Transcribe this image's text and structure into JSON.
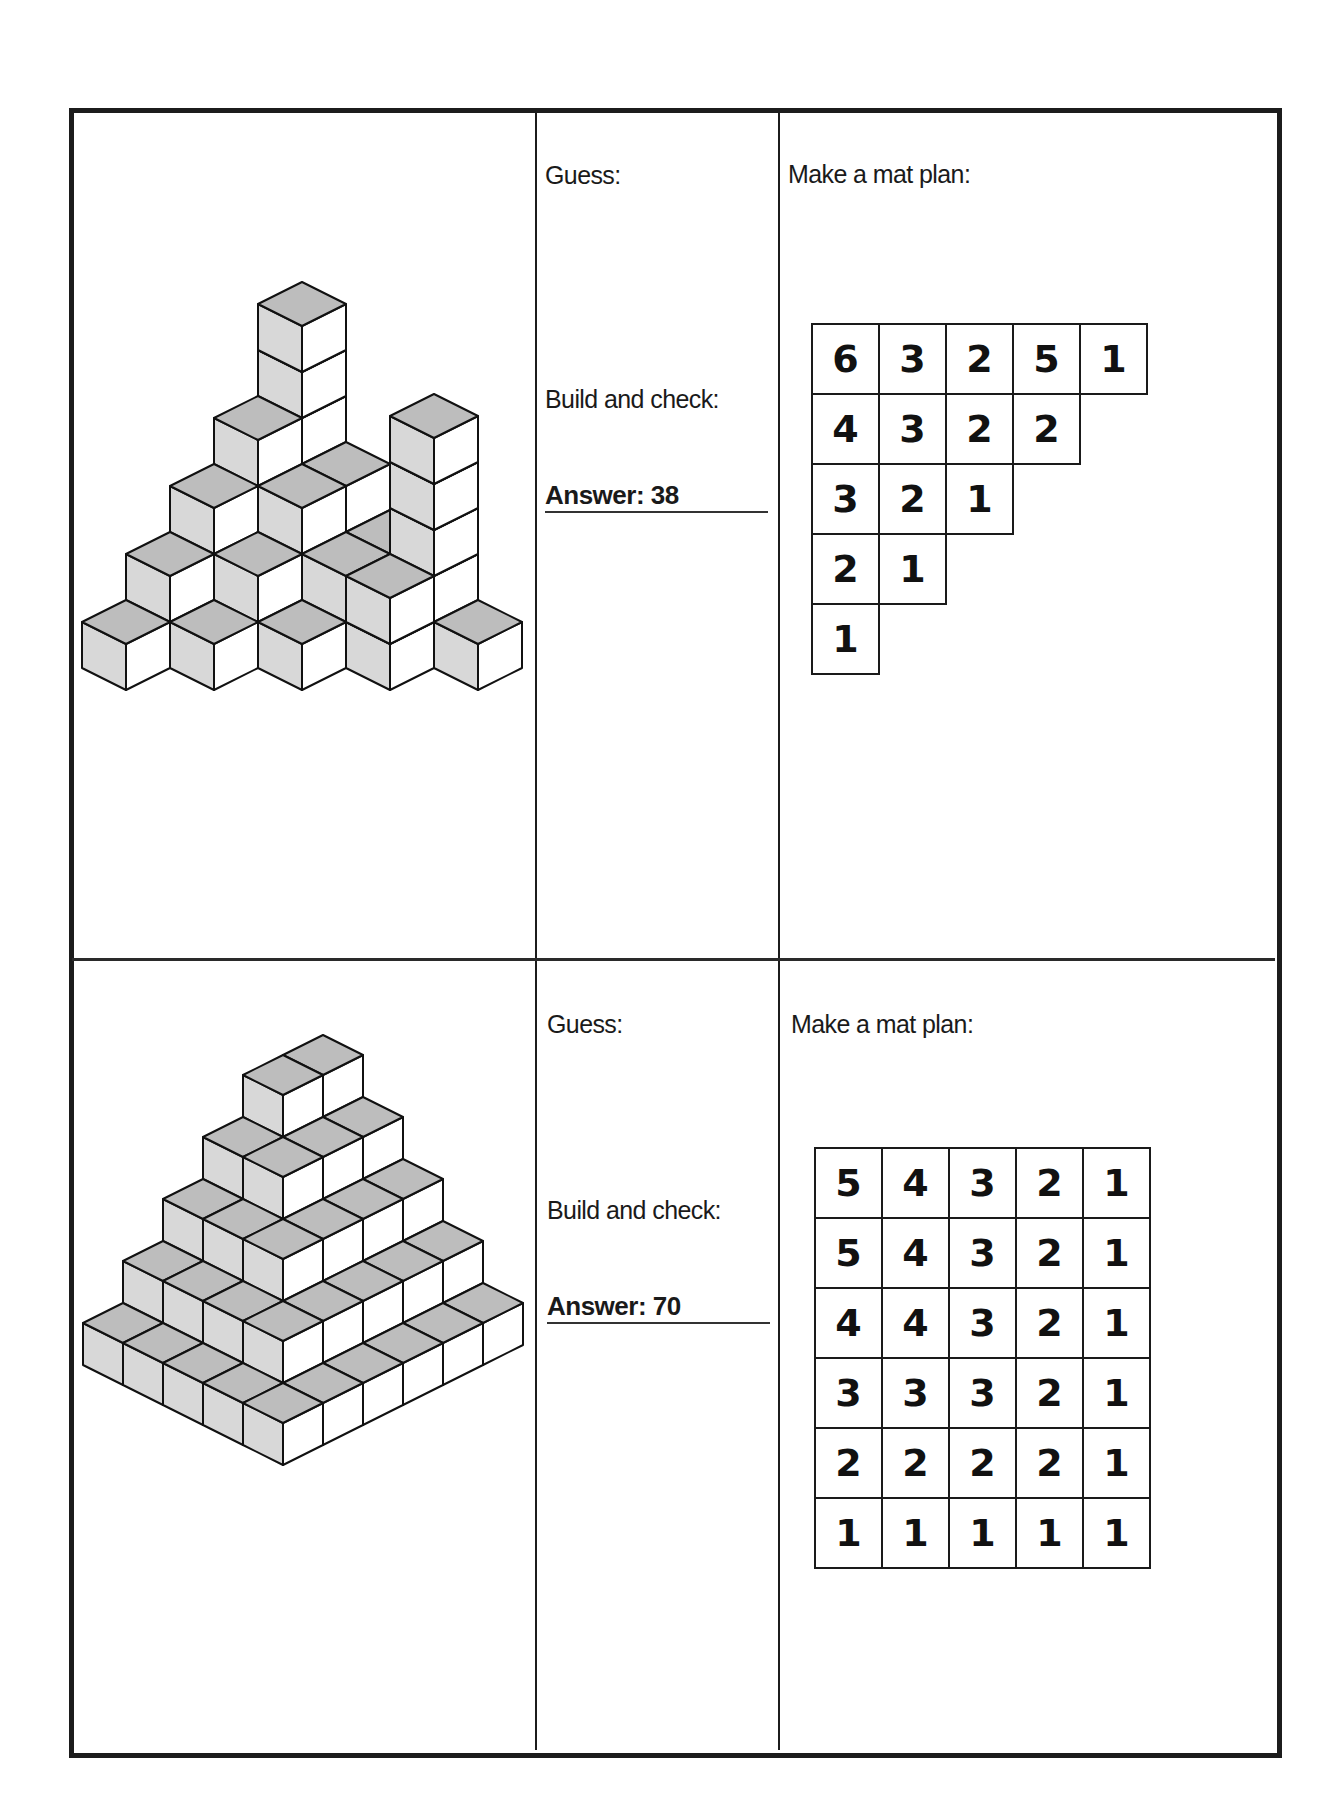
{
  "worksheet": {
    "problems": [
      {
        "guess_label": "Guess:",
        "build_label": "Build and check:",
        "answer_text": "Answer: 38",
        "answer_value": 38,
        "mat_plan_label": "Make a mat plan:",
        "mat_plan": [
          [
            6,
            3,
            2,
            5,
            1
          ],
          [
            4,
            3,
            2,
            2
          ],
          [
            3,
            2,
            1
          ],
          [
            2,
            1
          ],
          [
            1
          ]
        ]
      },
      {
        "guess_label": "Guess:",
        "build_label": "Build and check:",
        "answer_text": "Answer: 70",
        "answer_value": 70,
        "mat_plan_label": "Make a mat plan:",
        "mat_plan": [
          [
            5,
            4,
            3,
            2,
            1
          ],
          [
            5,
            4,
            3,
            2,
            1
          ],
          [
            4,
            4,
            3,
            2,
            1
          ],
          [
            3,
            3,
            3,
            2,
            1
          ],
          [
            2,
            2,
            2,
            2,
            1
          ],
          [
            1,
            1,
            1,
            1,
            1
          ]
        ]
      }
    ],
    "colors": {
      "cube_top": "#bdbdbd",
      "cube_left": "#d8d8d8",
      "cube_right": "#ffffff",
      "cube_edge": "#111111"
    }
  }
}
